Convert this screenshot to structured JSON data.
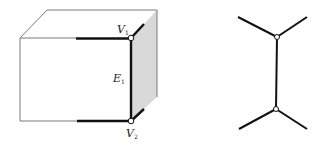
{
  "colors": {
    "thin_line": "#7a7a7a",
    "thick_line": "#111111",
    "shaded_face": "#d9d9d9",
    "vertex_fill": "#ffffff",
    "vertex_stroke": "#111111"
  },
  "cube": {
    "labels": {
      "v1": {
        "main": "V",
        "sub": "1"
      },
      "e1": {
        "main": "E",
        "sub": "1"
      },
      "v2": {
        "main": "V",
        "sub": "2"
      }
    }
  },
  "graph": {
    "description": "Edge E1 with endpoints V1 and V2, each vertex having two further incident edges"
  }
}
